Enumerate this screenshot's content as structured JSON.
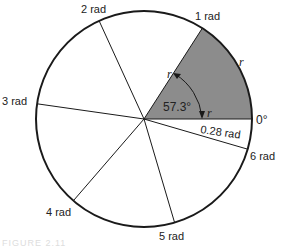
{
  "diagram": {
    "center": [
      144,
      119
    ],
    "radius": 108,
    "colors": {
      "sector_fill": "#8c8c8c",
      "stroke": "#1a1a1a"
    },
    "shaded_sector": {
      "from_rad": 0,
      "to_rad": 1
    },
    "labels": {
      "zero": "0°",
      "rad1": "1 rad",
      "rad2": "2 rad",
      "rad3": "3 rad",
      "rad4": "4 rad",
      "rad5": "5 rad",
      "rad6": "6 rad",
      "remainder": "0.28 rad",
      "angle": "57.3°",
      "r_radius_upper": "r",
      "r_arc": "r",
      "r_radius_lower": "r"
    },
    "spokes_rad": [
      1,
      2,
      3,
      4,
      5,
      6
    ]
  },
  "caption": "FIGURE 2.11"
}
